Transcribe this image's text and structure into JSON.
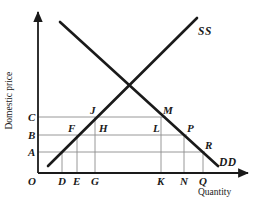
{
  "figure": {
    "type": "supply-demand-diagram",
    "axes": {
      "x_title": "Quantity",
      "y_title": "Domestic price",
      "x_origin_label": "O"
    },
    "colors": {
      "curve": "#1a1a1a",
      "grid": "#8c8c8c",
      "axis": "#1a1a1a",
      "background": "#ffffff",
      "text": "#1a1a1a"
    },
    "curves": [
      {
        "name": "supply",
        "label": "SS",
        "label_x": 198,
        "label_y": 26,
        "x1": 48,
        "y1": 166,
        "x2": 197,
        "y2": 18
      },
      {
        "name": "demand",
        "label": "DD",
        "label_x": 219,
        "label_y": 157,
        "x1": 60,
        "y1": 22,
        "x2": 218,
        "y2": 166
      }
    ],
    "price_levels": [
      {
        "label": "C",
        "y": 117,
        "label_x": 28,
        "label_y": 112,
        "x_end": 166
      },
      {
        "label": "B",
        "y": 135,
        "label_x": 28,
        "label_y": 130,
        "x_end": 187
      },
      {
        "label": "A",
        "y": 152,
        "label_x": 28,
        "label_y": 147,
        "x_end": 205
      }
    ],
    "quantity_ticks": [
      {
        "label": "D",
        "x": 62,
        "label_x": 58,
        "label_y": 176,
        "y_top": 152
      },
      {
        "label": "E",
        "x": 77,
        "label_x": 73,
        "label_y": 176,
        "y_top": 135
      },
      {
        "label": "G",
        "x": 95,
        "label_x": 91,
        "label_y": 176,
        "y_top": 117
      },
      {
        "label": "K",
        "x": 161,
        "label_x": 157,
        "label_y": 176,
        "y_top": 117
      },
      {
        "label": "N",
        "x": 184,
        "label_x": 180,
        "label_y": 176,
        "y_top": 135
      },
      {
        "label": "Q",
        "x": 203,
        "label_x": 199,
        "label_y": 176,
        "y_top": 152
      }
    ],
    "points": [
      {
        "label": "J",
        "label_x": 90,
        "label_y": 105
      },
      {
        "label": "M",
        "label_x": 163,
        "label_y": 105
      },
      {
        "label": "F",
        "label_x": 68,
        "label_y": 123
      },
      {
        "label": "H",
        "label_x": 99,
        "label_y": 123
      },
      {
        "label": "L",
        "label_x": 153,
        "label_y": 123
      },
      {
        "label": "P",
        "label_x": 187,
        "label_y": 123
      },
      {
        "label": "R",
        "label_x": 205,
        "label_y": 140
      }
    ],
    "origin_label": {
      "label": "O",
      "label_x": 28,
      "label_y": 176
    },
    "geometry": {
      "y_axis_x": 38,
      "y_axis_top": 12,
      "x_axis_y": 173,
      "x_axis_right": 248,
      "x_title_x": 198,
      "x_title_y": 188,
      "y_title_x": 14,
      "y_title_y": 120
    }
  },
  "chart_data": {
    "type": "line",
    "title": "",
    "xlabel": "Quantity",
    "ylabel": "Domestic price",
    "grid": true,
    "legend": "inline-curve-labels",
    "series": [
      {
        "name": "SS",
        "note": "upward-sloping supply curve"
      },
      {
        "name": "DD",
        "note": "downward-sloping demand curve"
      }
    ],
    "price_axis_categories": [
      "A",
      "B",
      "C"
    ],
    "quantity_axis_categories": [
      "O",
      "D",
      "E",
      "G",
      "K",
      "N",
      "Q"
    ],
    "annotated_points": [
      "J",
      "M",
      "F",
      "H",
      "L",
      "P",
      "R"
    ]
  }
}
